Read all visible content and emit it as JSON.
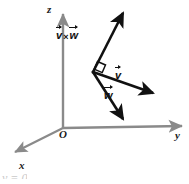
{
  "figure": {
    "background_color": "#ffffff",
    "axis_color": "#808080",
    "vector_color": "#111111",
    "label_color": "#1a1a1a"
  },
  "axes": {
    "z_label": "z",
    "y_label": "y",
    "x_label": "x",
    "origin_label": "O"
  },
  "vectors": {
    "cross": {
      "symbol_left": "v",
      "operator": "×",
      "symbol_right": "w",
      "label": "v × w"
    },
    "v": {
      "symbol": "v",
      "label": "v"
    },
    "w": {
      "symbol": "w",
      "label": "w"
    }
  },
  "markers": {
    "right_angle": "right-angle-marker"
  },
  "footer": {
    "cutoff_text": "y = 0"
  },
  "geometry": {
    "origin": [
      63,
      128
    ],
    "z_tip": [
      63,
      12
    ],
    "y_tip": [
      185,
      126
    ],
    "x_tip": [
      12,
      155
    ],
    "vertex": [
      93,
      72
    ],
    "cross_tip": [
      126,
      10
    ],
    "v_tip": [
      158,
      96
    ],
    "w_tip": [
      126,
      123
    ]
  }
}
